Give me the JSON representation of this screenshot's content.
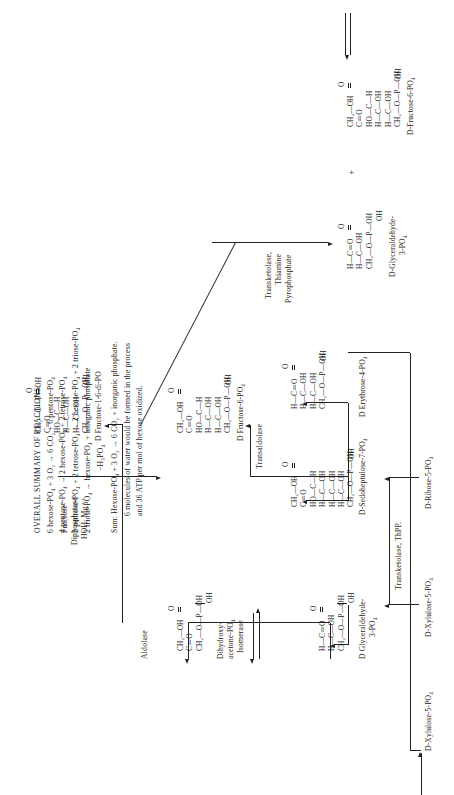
{
  "metabolites": {
    "ribose5p": "D-Ribose-5-PO₄",
    "xylulose5p": "D-Xylulose-5-PO₄",
    "dihydroxyacetone": "Dihydroxy-\nacetone-PO₄",
    "dihydroxyacetone_l1": "Dihydroxy-",
    "dihydroxyacetone_l2": "acetone-PO₄",
    "g3p_l1": "D Glyceraldehyde-",
    "g3p_l2": "3-PO₄",
    "sedoheptulose7p": "D-Sedoheptulose-7-PO₄",
    "erythrose4p": "D Erythrose-4-PO₄",
    "fructose16dp": "D Fructose-1-6-di-PO",
    "fructose6p_right": "D Fructose-6-PO₄",
    "fructose6p_bottom": "D-Fructose-6-PO₄",
    "g3p_bottom_l1": "D-Glyceraldehyde-",
    "g3p_bottom_l2": "3-PO₄",
    "plus": "+"
  },
  "enzymes": {
    "transketolase_thpp": "Transketolase, ThPP.",
    "isomerase": "Isomerase",
    "aldolase": "Aldolase",
    "transaldolase": "Transaldolase",
    "fructose_diphosphatase_l1": "Fructose",
    "fructose_diphosphatase_l2": "Diphosphatase",
    "fructose_diphosphatase_l3": "HOH, Mg⁺⁺",
    "water_loss": "−H₃PO₄",
    "transketolase_tpp_l1": "Transketolase,",
    "transketolase_tpp_l2": "Thiamine",
    "transketolase_tpp_l3": "Pyrophosphate"
  },
  "structures": {
    "dihydroxyacetone_po4": [
      "CH₂—OH",
      "C＝O",
      "CH₂—O—P—OH"
    ],
    "dihydroxyacetone_extra": [
      "O",
      "OH"
    ],
    "glyceraldehyde_3_po4": [
      "H—C＝O",
      "H—C—OH",
      "CH₂—O—P—OH"
    ],
    "glyceraldehyde_extra": [
      "O",
      "OH"
    ],
    "sedoheptulose_7_po4": [
      "CH₂—OH",
      "C＝O",
      "HO—C—H",
      "H—C—OH",
      "H—C—OH",
      "H—C—OH",
      "CH₂—O—P—OH"
    ],
    "erythrose_4_po4": [
      "H—C＝O",
      "H—C—OH",
      "H—C—OH",
      "CH₂—O—P—OH"
    ],
    "fructose_1_6_di_po4": [
      "CH₂—O—P—OH",
      "C＝O",
      "HO—C—H",
      "H—C—OH",
      "H—C—OH",
      "CH₂—O—P—OH"
    ],
    "fructose_6_po4": [
      "CH₂—OH",
      "C＝O",
      "HO—C—H",
      "H—C—OH",
      "H—C—OH",
      "CH₂—O—P—OH"
    ],
    "phosphate_o": "O",
    "phosphate_oh": "OH"
  },
  "summary": {
    "title": "OVERALL SUMMARY OF REACTIONS:",
    "reactions": [
      "6 hexose-PO₄ + 3 O₂ → 6 CO₂ + 6 pentose-PO₄",
      "4 pentose-PO₄ → 2 hexose-PO₄ + 2 tetrose-PO₄",
      "2 pentose-PO₄ + 2 tetrose-PO₄ → 2 hexose-PO₄ + 2 triose-PO₄",
      "2 triose-PO₄ → hexose-PO₄ + inorganic phosphate"
    ],
    "sum_lines": [
      "Sum: Hexose-PO₄ + 3 O₂ → 6 CO₂ + inorganic phosphate.",
      "6 molecules of water would be formed in the process",
      "and 36 ATP per mol of hexose oxidized."
    ]
  }
}
